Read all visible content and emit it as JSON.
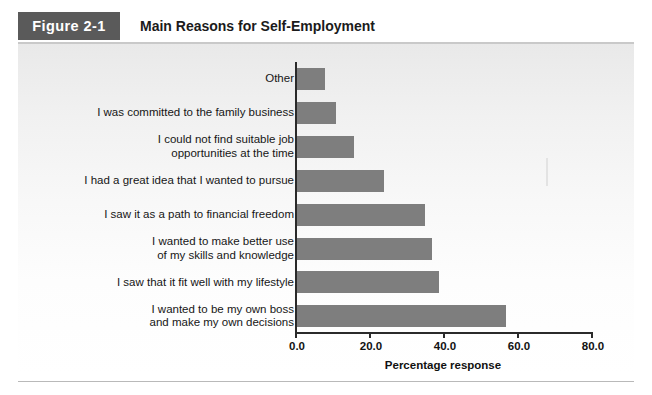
{
  "figure": {
    "number": "Figure 2-1",
    "title": "Main Reasons for Self-Employment",
    "number_box_color": "#5a5a5a",
    "bar_color": "#7e7e7e",
    "panel_background": "#f2f2f2"
  },
  "chart_data": {
    "type": "bar",
    "orientation": "horizontal",
    "title": "Main Reasons for Self-Employment",
    "xlabel": "Percentage response",
    "ylabel": "",
    "xlim": [
      0.0,
      80.0
    ],
    "xticks": [
      "0.0",
      "20.0",
      "40.0",
      "60.0",
      "80.0"
    ],
    "grid": false,
    "legend": false,
    "categories": [
      "Other",
      "I was committed to the family business",
      "I could not find suitable job opportunities at the time",
      "I had a great idea that I wanted to pursue",
      "I saw it as a path to financial freedom",
      "I wanted to make better use of my skills and knowledge",
      "I saw that it fit well with my lifestyle",
      "I wanted to be my own boss and make my own decisions"
    ],
    "category_lines": [
      [
        "Other"
      ],
      [
        "I was committed to the family business"
      ],
      [
        "I could not find suitable job",
        "opportunities at the time"
      ],
      [
        "I had a great idea that I wanted to pursue"
      ],
      [
        "I saw it as a path to financial freedom"
      ],
      [
        "I wanted to make better use",
        "of my skills and knowledge"
      ],
      [
        "I saw that it fit well with my lifestyle"
      ],
      [
        "I wanted to be my own boss",
        "and make my own decisions"
      ]
    ],
    "values": [
      8,
      11,
      16,
      24,
      35,
      37,
      39,
      57
    ]
  }
}
